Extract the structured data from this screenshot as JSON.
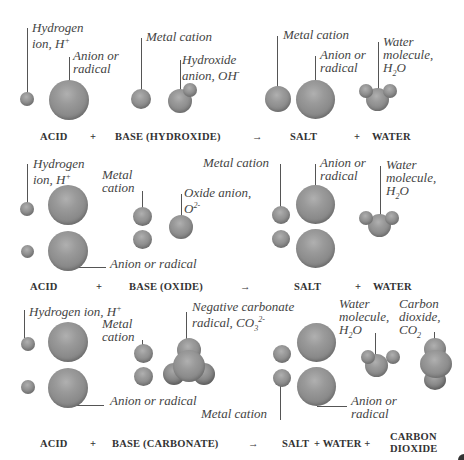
{
  "rows": [
    {
      "id": "hydroxide",
      "equation": {
        "acid": "ACID",
        "plus1": "+",
        "base": "BASE (HYDROXIDE)",
        "arrow": "→",
        "salt": "SALT",
        "plus2": "+",
        "water": "WATER"
      },
      "labels": {
        "hydrogen_1": "Hydrogen",
        "hydrogen_2": "ion, H",
        "hydrogen_sup": "+",
        "anion_1": "Anion or",
        "anion_2": "radical",
        "metal": "Metal cation",
        "hydroxide_1": "Hydroxide",
        "hydroxide_2": "anion, OH",
        "hydroxide_sup": "-",
        "salt_metal": "Metal cation",
        "salt_anion_1": "Anion or",
        "salt_anion_2": "radical",
        "water_1": "Water",
        "water_2": "molecule,",
        "water_3a": "H",
        "water_3sub": "2",
        "water_3b": "O"
      }
    },
    {
      "id": "oxide",
      "equation": {
        "acid": "ACID",
        "plus1": "+",
        "base": "BASE (OXIDE)",
        "arrow": "→",
        "salt": "SALT",
        "plus2": "+",
        "water": "WATER"
      },
      "labels": {
        "hydrogen_1": "Hydrogen",
        "hydrogen_2": "ion, H",
        "hydrogen_sup": "+",
        "metal_1": "Metal",
        "metal_2": "cation",
        "oxide_1": "Oxide anion,",
        "oxide_2": "O",
        "oxide_sup": "2-",
        "anion": "Anion or radical",
        "salt_metal": "Metal cation",
        "salt_anion_1": "Anion or",
        "salt_anion_2": "radical",
        "water_1": "Water",
        "water_2": "molecule,",
        "water_3a": "H",
        "water_3sub": "2",
        "water_3b": "O"
      }
    },
    {
      "id": "carbonate",
      "equation": {
        "acid": "ACID",
        "plus1": "+",
        "base": "BASE (CARBONATE)",
        "arrow": "→",
        "salt": "SALT",
        "plus2": "+ WATER +",
        "co2_1": "CARBON",
        "co2_2": "DIOXIDE"
      },
      "labels": {
        "hydrogen": "Hydrogen ion, H",
        "hydrogen_sup": "+",
        "metal_1": "Metal",
        "metal_2": "cation",
        "carbonate_1": "Negative carbonate",
        "carbonate_2": "radical, CO",
        "carbonate_sub": "3",
        "carbonate_sup": "2-",
        "anion": "Anion or radical",
        "salt_metal": "Metal cation",
        "salt_anion_1": "Anion or",
        "salt_anion_2": "radical",
        "water_1": "Water",
        "water_2": "molecule,",
        "water_3a": "H",
        "water_3sub": "2",
        "water_3b": "O",
        "co2_1": "Carbon",
        "co2_2": "dioxide,",
        "co2_3a": "CO",
        "co2_3sub": "2"
      }
    }
  ]
}
